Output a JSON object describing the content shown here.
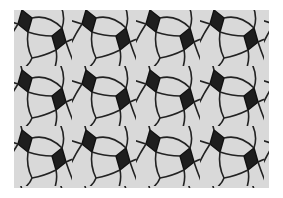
{
  "image": {
    "description": "Black-and-white tessellation of curved light quadrilateral tiles interleaved with dark rhombus tiles",
    "colors": {
      "background": "#ffffff",
      "tile_light": "#dadada",
      "tile_dark": "#1c1c1c",
      "line": "#222222"
    }
  }
}
